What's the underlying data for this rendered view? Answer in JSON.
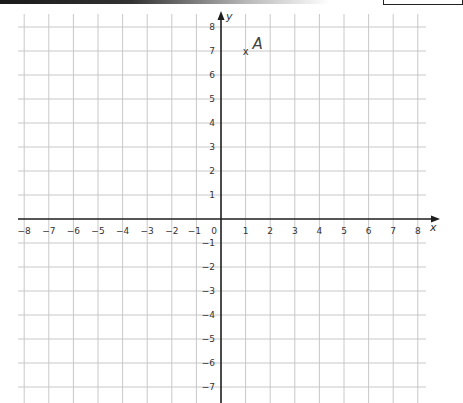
{
  "chart_data": {
    "type": "scatter",
    "title": "",
    "xlabel": "x",
    "ylabel": "y",
    "xlim": [
      -8,
      8
    ],
    "ylim": [
      -8,
      8
    ],
    "grid": true,
    "x_ticks": [
      "−8",
      "−7",
      "−6",
      "−5",
      "−4",
      "−3",
      "−2",
      "−1",
      "0",
      "1",
      "2",
      "3",
      "4",
      "5",
      "6",
      "7",
      "8"
    ],
    "y_ticks_positive": [
      "1",
      "2",
      "3",
      "4",
      "5",
      "6",
      "7",
      "8"
    ],
    "y_ticks_negative": [
      "−1",
      "−2",
      "−3",
      "−4",
      "−5",
      "−6",
      "−7"
    ],
    "points": [
      {
        "label": "A",
        "x": 1,
        "y": 7,
        "marker": "x"
      }
    ]
  },
  "colors": {
    "grid": "#c8c8c8",
    "axis": "#1e1e1e",
    "text": "#333333"
  }
}
